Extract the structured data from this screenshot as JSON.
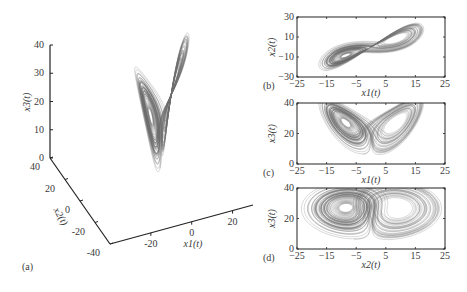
{
  "figure": {
    "trajectory_color": "#6e6e6e",
    "axis_color": "#222222"
  },
  "chart_data": [
    {
      "id": "a",
      "panel_label": "(a)",
      "type": "line3d",
      "xlabel": "x1(t)",
      "ylabel": "x2(t)",
      "zlabel": "x3(t)",
      "xlim": [
        -40,
        30
      ],
      "ylim": [
        -40,
        40
      ],
      "zlim": [
        0,
        40
      ],
      "x_ticks": [
        "-20",
        "0",
        "20"
      ],
      "y_ticks": [
        "-40",
        "-20",
        "0",
        "20",
        "40"
      ],
      "z_ticks": [
        "0",
        "10",
        "20",
        "30",
        "40"
      ],
      "series": [
        {
          "name": "trajectory",
          "system": "Lorenz",
          "params": {
            "sigma": 10,
            "rho": 28,
            "beta": 2.6667
          }
        }
      ]
    },
    {
      "id": "b",
      "panel_label": "(b)",
      "type": "line",
      "xlabel": "x1(t)",
      "ylabel": "x2(t)",
      "xlim": [
        -25,
        25
      ],
      "ylim": [
        -30,
        30
      ],
      "x_ticks": [
        "-25",
        "-15",
        "-5",
        "5",
        "15",
        "25"
      ],
      "y_ticks": [
        "30",
        "10",
        "-10",
        "-30"
      ],
      "projection": [
        "x1",
        "x2"
      ]
    },
    {
      "id": "c",
      "panel_label": "(c)",
      "type": "line",
      "xlabel": "x1(t)",
      "ylabel": "x3(t)",
      "xlim": [
        -25,
        25
      ],
      "ylim": [
        0,
        40
      ],
      "x_ticks": [
        "-25",
        "-15",
        "-5",
        "5",
        "15",
        "25"
      ],
      "y_ticks": [
        "40",
        "20",
        "0"
      ],
      "projection": [
        "x1",
        "x3"
      ]
    },
    {
      "id": "d",
      "panel_label": "(d)",
      "type": "line",
      "xlabel": "x2(t)",
      "ylabel": "x3(t)",
      "xlim": [
        -25,
        25
      ],
      "ylim": [
        0,
        40
      ],
      "x_ticks": [
        "-25",
        "-15",
        "-5",
        "5",
        "15",
        "25"
      ],
      "y_ticks": [
        "40",
        "20",
        "0"
      ],
      "projection": [
        "x2",
        "x3"
      ]
    }
  ]
}
